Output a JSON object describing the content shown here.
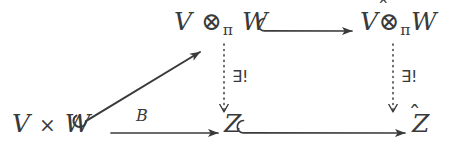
{
  "diagram": {
    "kind": "commutative-diagram",
    "background_color": "#ffffff",
    "ink_color": "#3a3a3a",
    "nodes": {
      "top_left": {
        "v": "V",
        "tensor": "⊗",
        "hat": "",
        "pi": "π",
        "w": "W"
      },
      "top_right": {
        "v": "V",
        "tensor": "⊗",
        "hat": "̂",
        "pi": "π",
        "w": "W"
      },
      "bottom_left": {
        "v": "V",
        "times": "×",
        "w": "W"
      },
      "bottom_middle": {
        "z": "Z"
      },
      "bottom_right": {
        "z": "Z",
        "hat": "̂"
      }
    },
    "edges": {
      "diagonal": {
        "label": "",
        "style": "solid-hooked",
        "from": "bottom_left",
        "to": "top_left"
      },
      "bottom_left_to_z": {
        "label": "B",
        "style": "solid",
        "from": "bottom_left",
        "to": "bottom_middle"
      },
      "top_inclusion": {
        "label": "",
        "style": "solid-hooked",
        "from": "top_left",
        "to": "top_right"
      },
      "bottom_inclusion": {
        "label": "",
        "style": "solid-hooked",
        "from": "bottom_middle",
        "to": "bottom_right"
      },
      "left_vertical": {
        "label": "∃!",
        "style": "dotted",
        "from": "top_left",
        "to": "bottom_middle"
      },
      "right_vertical": {
        "label": "∃!",
        "style": "dotted",
        "from": "top_right",
        "to": "bottom_right"
      }
    }
  }
}
